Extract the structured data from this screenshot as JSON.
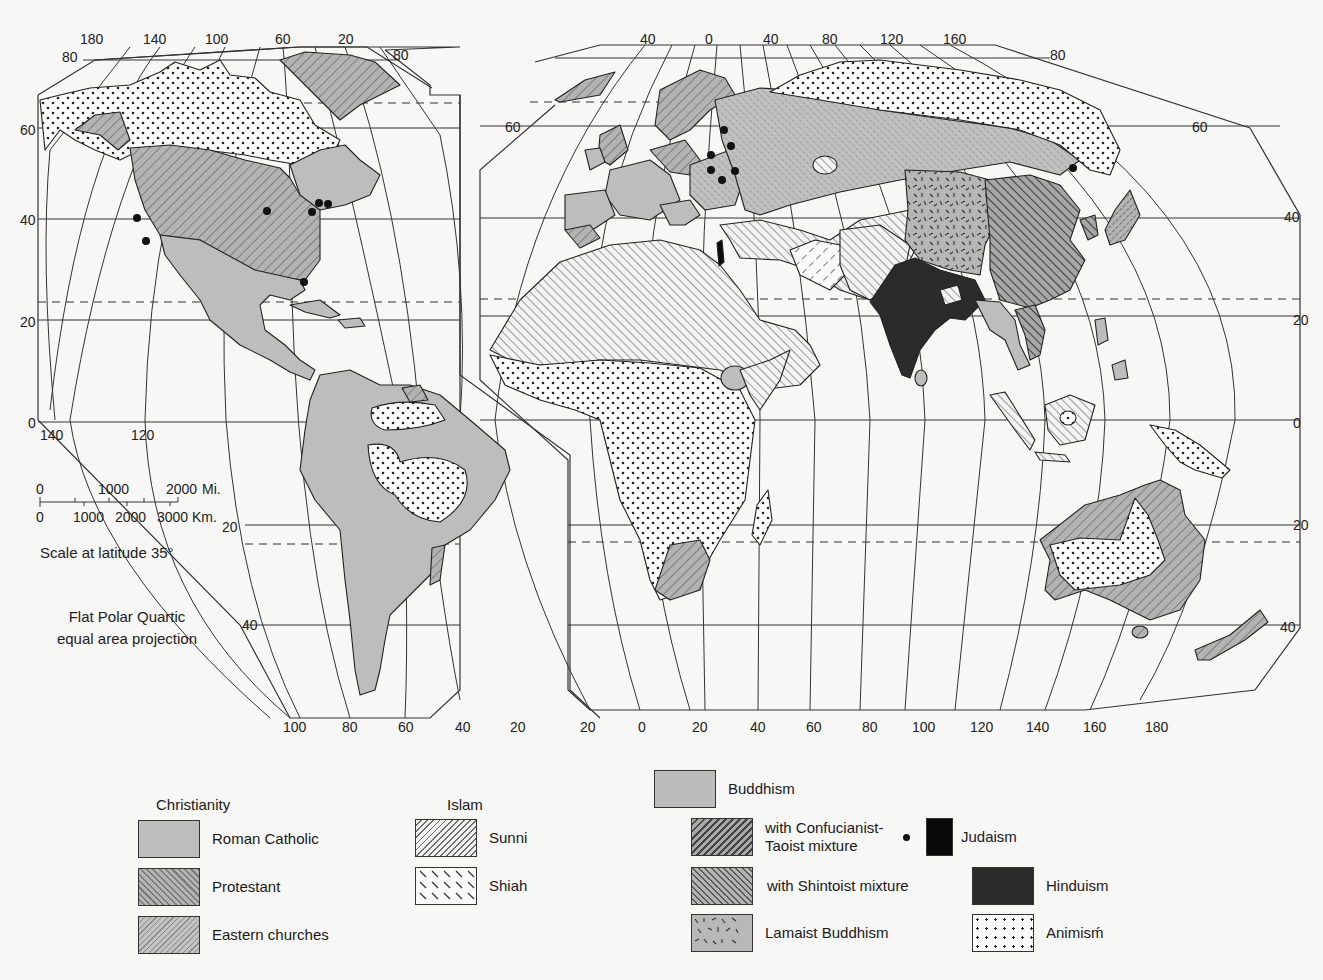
{
  "map": {
    "title": "World Religions",
    "projection_note": [
      "Flat Polar Quartic",
      "equal area projection"
    ],
    "scale": {
      "miles_ticks": [
        "0",
        "1000",
        "2000"
      ],
      "miles_unit": "Mi.",
      "km_ticks": [
        "0",
        "1000",
        "2000",
        "3000"
      ],
      "km_unit": "Km.",
      "caption": "Scale at latitude 35°"
    },
    "west_panel": {
      "top_longitudes": [
        "180",
        "140",
        "100",
        "60",
        "20"
      ],
      "bottom_longitudes": [
        "100",
        "80",
        "60",
        "40",
        "20"
      ],
      "equator_longitudes": [
        "140",
        "120"
      ],
      "left_latitudes": [
        "80",
        "60",
        "40",
        "20",
        "0"
      ],
      "right_latitudes": [
        "80",
        "20",
        "40"
      ]
    },
    "east_panel": {
      "top_longitudes": [
        "40",
        "0",
        "40",
        "80",
        "120",
        "160"
      ],
      "bottom_longitudes": [
        "20",
        "0",
        "20",
        "40",
        "60",
        "80",
        "100",
        "120",
        "140",
        "160",
        "180"
      ],
      "left_latitudes": [
        "60"
      ],
      "right_latitudes": [
        "80",
        "60",
        "40",
        "20",
        "0",
        "20",
        "40"
      ]
    },
    "colors": {
      "roman_catholic": "#bdbdbd",
      "protestant": "#9a9a9a",
      "buddhism": "#bcbcbc",
      "hinduism": "#2b2b2b",
      "judaism": "#0a0a0a",
      "animism": "#fdfdfd",
      "outline": "#222222"
    }
  },
  "legend": {
    "groups": [
      {
        "heading": "Christianity",
        "items": [
          {
            "label": "Roman Catholic",
            "pattern": "solid-gray"
          },
          {
            "label": "Protestant",
            "pattern": "diagonal-hatch"
          },
          {
            "label": "Eastern churches",
            "pattern": "fine-diagonal-hatch"
          }
        ]
      },
      {
        "heading": "Islam",
        "items": [
          {
            "label": "Sunni",
            "pattern": "light-diagonal-hatch"
          },
          {
            "label": "Shiah",
            "pattern": "dashed-back-slash"
          }
        ]
      },
      {
        "heading": "",
        "items": [
          {
            "label": "Buddhism",
            "pattern": "solid-gray"
          },
          {
            "label": "with Confucianist-\nTaoist mixture",
            "pattern": "dark-diagonal-hatch"
          },
          {
            "label": "with Shintoist mixture",
            "pattern": "dark-slash-hatch"
          },
          {
            "label": "Lamaist Buddhism",
            "pattern": "random-dashes"
          }
        ]
      },
      {
        "heading": "",
        "items": [
          {
            "label": "Judaism",
            "pattern": "black-with-dot"
          },
          {
            "label": "Hinduism",
            "pattern": "dark-solid"
          },
          {
            "label": "Animisḿ",
            "pattern": "dots"
          }
        ]
      }
    ]
  }
}
